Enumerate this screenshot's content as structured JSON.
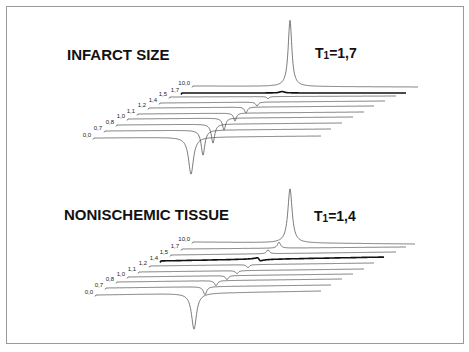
{
  "chart_data": [
    {
      "type": "line",
      "subtype": "stacked-waterfall-spectra",
      "title": "INFARCT SIZE",
      "annotation": "T1=1,7",
      "series_labels": [
        "0,0",
        "0,7",
        "0,8",
        "1,0",
        "1,1",
        "1,2",
        "1,4",
        "1,5",
        "1,7",
        "10,0"
      ],
      "highlighted_series": "1,7",
      "series": [
        {
          "name": "0,0",
          "start": [
            93,
            138
          ],
          "end": [
            321,
            136
          ],
          "peak_x": 191,
          "amp": -37,
          "width": 3.0
        },
        {
          "name": "0,7",
          "start": [
            104,
            131
          ],
          "end": [
            331,
            129
          ],
          "peak_x": 203,
          "amp": -25,
          "width": 2.2
        },
        {
          "name": "0,8",
          "start": [
            116,
            125
          ],
          "end": [
            342,
            123
          ],
          "peak_x": 213,
          "amp": -19,
          "width": 2.0
        },
        {
          "name": "1,0",
          "start": [
            127,
            119
          ],
          "end": [
            353,
            117
          ],
          "peak_x": 224,
          "amp": -12,
          "width": 1.8
        },
        {
          "name": "1,1",
          "start": [
            137,
            114
          ],
          "end": [
            364,
            112
          ],
          "peak_x": 235,
          "amp": -8,
          "width": 1.6
        },
        {
          "name": "1,2",
          "start": [
            148,
            108
          ],
          "end": [
            374,
            106
          ],
          "peak_x": 246,
          "amp": -6,
          "width": 1.6
        },
        {
          "name": "1,4",
          "start": [
            159,
            103
          ],
          "end": [
            385,
            101
          ],
          "peak_x": 257,
          "amp": -4,
          "width": 1.5
        },
        {
          "name": "1,5",
          "start": [
            169,
            97
          ],
          "end": [
            396,
            96
          ],
          "peak_x": 268,
          "amp": -2,
          "width": 1.5
        },
        {
          "name": "1,7",
          "start": [
            181,
            93
          ],
          "end": [
            406,
            93
          ],
          "peak_x": 282,
          "amp": 1.5,
          "width": 3.0
        },
        {
          "name": "10,0",
          "start": [
            192,
            86
          ],
          "end": [
            418,
            87
          ],
          "peak_x": 290,
          "amp": 66,
          "width": 2.2
        }
      ]
    },
    {
      "type": "line",
      "subtype": "stacked-waterfall-spectra",
      "title": "NONISCHEMIC TISSUE",
      "annotation": "T1=1,4",
      "series_labels": [
        "0,0",
        "0,7",
        "0,8",
        "1,0",
        "1,1",
        "1,2",
        "1,4",
        "1,5",
        "1,7",
        "10,0"
      ],
      "highlighted_series": "1,4",
      "series": [
        {
          "name": "0,0",
          "start": [
            95,
            295
          ],
          "end": [
            321,
            291
          ],
          "peak_x": 194,
          "amp": -36,
          "width": 3.0
        },
        {
          "name": "0,7",
          "start": [
            105,
            288
          ],
          "end": [
            331,
            285
          ],
          "peak_x": 205,
          "amp": -8,
          "width": 2.0
        },
        {
          "name": "0,8",
          "start": [
            116,
            282
          ],
          "end": [
            342,
            279
          ],
          "peak_x": 216,
          "amp": -5,
          "width": 1.8
        },
        {
          "name": "1,0",
          "start": [
            127,
            277
          ],
          "end": [
            353,
            274
          ],
          "peak_x": 227,
          "amp": -4,
          "width": 1.6
        },
        {
          "name": "1,1",
          "start": [
            138,
            272
          ],
          "end": [
            364,
            269
          ],
          "peak_x": 237,
          "amp": -3,
          "width": 1.6
        },
        {
          "name": "1,2",
          "start": [
            149,
            266
          ],
          "end": [
            374,
            263
          ],
          "peak_x": 248,
          "amp": -3,
          "width": 1.6
        },
        {
          "name": "1,4",
          "start": [
            160,
            261
          ],
          "end": [
            384,
            257
          ],
          "peak_x": 259,
          "amp": 0,
          "width": 1.8,
          "dispersive": 3
        },
        {
          "name": "1,5",
          "start": [
            170,
            255
          ],
          "end": [
            396,
            252
          ],
          "peak_x": 268,
          "amp": 4,
          "width": 1.6
        },
        {
          "name": "1,7",
          "start": [
            181,
            249
          ],
          "end": [
            406,
            247
          ],
          "peak_x": 279,
          "amp": 6,
          "width": 1.8
        },
        {
          "name": "10,0",
          "start": [
            192,
            242
          ],
          "end": [
            415,
            244
          ],
          "peak_x": 290,
          "amp": 54,
          "width": 2.6
        }
      ]
    }
  ],
  "panels": [
    {
      "title": "INFARCT SIZE",
      "t1_label": "T",
      "t1_sub": "1",
      "t1_value": "=1,7"
    },
    {
      "title": "NONISCHEMIC TISSUE",
      "t1_label": "T",
      "t1_sub": "1",
      "t1_value": "=1,4"
    }
  ]
}
